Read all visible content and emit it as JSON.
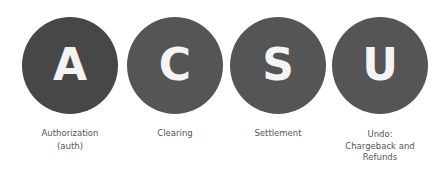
{
  "diagram": {
    "type": "process-steps",
    "steps": [
      {
        "letter": "A",
        "label_lines": [
          "Authorization",
          "(auth)"
        ],
        "color": "#474747"
      },
      {
        "letter": "C",
        "label_lines": [
          "Clearing"
        ],
        "color": "#555555"
      },
      {
        "letter": "S",
        "label_lines": [
          "Settlement"
        ],
        "color": "#555555"
      },
      {
        "letter": "U",
        "label_lines": [
          "Undo:",
          "Chargeback and",
          "Refunds"
        ],
        "color": "#555555"
      }
    ]
  }
}
